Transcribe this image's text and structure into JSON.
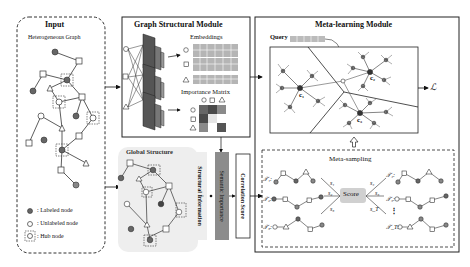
{
  "input": {
    "title": "Input",
    "subtitle": "Heterogeneous Graph",
    "legend": [
      {
        "symbol": "filled-circle",
        "label": ": Labeled node"
      },
      {
        "symbol": "hollow-circle",
        "label": ": Unlabeled node"
      },
      {
        "symbol": "hub-box",
        "label": ": Hub node"
      }
    ]
  },
  "graph_structural_module": {
    "title": "Graph Structural Module",
    "embeddings_label": "Embeddings",
    "importance_matrix_label": "Importance Matrix",
    "importance_matrix_headers": [
      "○",
      "□",
      "△"
    ],
    "embedding_rows": [
      "○",
      "□",
      "△"
    ]
  },
  "global_structure": {
    "title": "Global Structure",
    "structural_information": "Structural Information",
    "semantic_importance": "Semantic Importance",
    "operator": "•",
    "correlation_score": "Correlation Score"
  },
  "meta_learning": {
    "title": "Meta-learning Module",
    "query_label": "Query",
    "clusters": [
      "c₁",
      "c₂",
      "c₃"
    ],
    "loss_label": "ℒ"
  },
  "meta_sampling": {
    "title": "Meta-sampling",
    "score_label": "Score",
    "tasks_left": [
      "𝒯₁:",
      "𝒯₂:",
      "𝒯₃:"
    ],
    "tasks_right": [
      "𝒯₄:",
      "𝒯₅:",
      "𝒯_T:"
    ],
    "scores_left": [
      "s₁",
      "s₂",
      "s₃"
    ],
    "scores_right": [
      "s₄",
      "s₅",
      "s_T"
    ],
    "ellipsis": "⋮"
  },
  "colors": {
    "labeled_node": "#666666",
    "embedding_cell": "#b5b5b5",
    "importance_dark": "#4a4a4a",
    "importance_mid": "#8a8a8a",
    "semantic_bar": "#8c8c8c",
    "structural_bar": "#eeeeee",
    "score_box": "#d0d0d0",
    "global_bg": "#eeeeee"
  }
}
